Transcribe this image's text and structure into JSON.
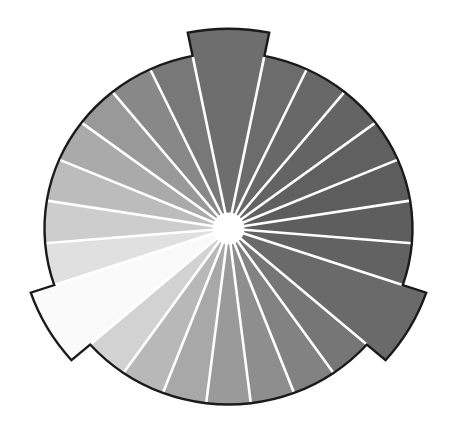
{
  "diagram": {
    "type": "radial-segmented-wheel",
    "center": [
      228.5,
      228.5
    ],
    "radius_x": 184,
    "radius_y": 176,
    "hub_radius": 16,
    "protrusion_radius_scale": 1.135,
    "separator_color": "#ffffff",
    "outline_color": "#1a1a1a",
    "segments": [
      {
        "start": -101.25,
        "end": -78.75,
        "fill": "#6e6e6e",
        "protrude": true
      },
      {
        "start": -78.75,
        "end": -64.82,
        "fill": "#6c6c6c",
        "protrude": false
      },
      {
        "start": -64.82,
        "end": -50.89,
        "fill": "#686868",
        "protrude": false
      },
      {
        "start": -50.89,
        "end": -36.96,
        "fill": "#646464",
        "protrude": false
      },
      {
        "start": -36.96,
        "end": -23.04,
        "fill": "#606060",
        "protrude": false
      },
      {
        "start": -23.04,
        "end": -9.11,
        "fill": "#5d5d5d",
        "protrude": false
      },
      {
        "start": -9.11,
        "end": 4.82,
        "fill": "#5e5e5e",
        "protrude": false
      },
      {
        "start": 4.82,
        "end": 18.75,
        "fill": "#626262",
        "protrude": false
      },
      {
        "start": 18.75,
        "end": 41.25,
        "fill": "#6a6a6a",
        "protrude": true
      },
      {
        "start": 41.25,
        "end": 55.18,
        "fill": "#767676",
        "protrude": false
      },
      {
        "start": 55.18,
        "end": 69.11,
        "fill": "#828282",
        "protrude": false
      },
      {
        "start": 69.11,
        "end": 83.04,
        "fill": "#8e8e8e",
        "protrude": false
      },
      {
        "start": 83.04,
        "end": 96.96,
        "fill": "#9a9a9a",
        "protrude": false
      },
      {
        "start": 96.96,
        "end": 110.89,
        "fill": "#a8a8a8",
        "protrude": false
      },
      {
        "start": 110.89,
        "end": 124.82,
        "fill": "#b8b8b8",
        "protrude": false
      },
      {
        "start": 124.82,
        "end": 138.75,
        "fill": "#d2d2d2",
        "protrude": false
      },
      {
        "start": 138.75,
        "end": 161.25,
        "fill": "#fafafa",
        "protrude": true
      },
      {
        "start": 161.25,
        "end": 175.18,
        "fill": "#e0e0e0",
        "protrude": false
      },
      {
        "start": 175.18,
        "end": 189.11,
        "fill": "#cdcdcd",
        "protrude": false
      },
      {
        "start": 189.11,
        "end": 203.04,
        "fill": "#bcbcbc",
        "protrude": false
      },
      {
        "start": 203.04,
        "end": 216.96,
        "fill": "#aaaaaa",
        "protrude": false
      },
      {
        "start": 216.96,
        "end": 230.89,
        "fill": "#999999",
        "protrude": false
      },
      {
        "start": 230.89,
        "end": 244.82,
        "fill": "#888888",
        "protrude": false
      },
      {
        "start": 244.82,
        "end": 258.75,
        "fill": "#787878",
        "protrude": false
      }
    ]
  }
}
